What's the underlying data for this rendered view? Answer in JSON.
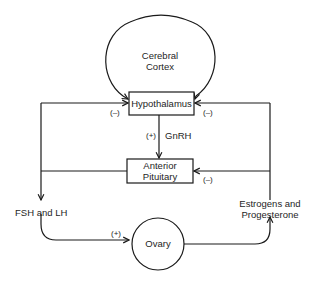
{
  "diagram": {
    "type": "flowchart",
    "title": "",
    "nodes": [
      {
        "id": "cortex",
        "label_lines": [
          "Cerebral",
          "Cortex"
        ],
        "shape": "ellipse"
      },
      {
        "id": "hypothalamus",
        "label": "Hypothalamus",
        "shape": "rectangle"
      },
      {
        "id": "pituitary",
        "label_lines": [
          "Anterior",
          "Pituitary"
        ],
        "shape": "rectangle"
      },
      {
        "id": "ovary",
        "label": "Ovary",
        "shape": "circle"
      }
    ],
    "edge_labels": {
      "gnrh": "GnRH",
      "gnrh_sign": "(+)",
      "fsh_lh": "FSH and LH",
      "ovary_sign": "(+)",
      "hormones_line1": "Estrogens and",
      "hormones_line2": "Progesterone",
      "neg_hypo_left": "(–)",
      "neg_hypo_right": "(–)",
      "neg_pituitary_right": "(–)"
    },
    "edges": [
      {
        "from": "hypothalamus",
        "to": "pituitary",
        "label": "GnRH",
        "sign": "+"
      },
      {
        "from": "pituitary",
        "to": "ovary",
        "label": "FSH and LH",
        "sign": "+"
      },
      {
        "from": "pituitary",
        "to": "hypothalamus",
        "sign": "-",
        "note": "short loop feedback via left line"
      },
      {
        "from": "ovary",
        "to": "pituitary",
        "label": "Estrogens and Progesterone",
        "sign": "-"
      },
      {
        "from": "ovary",
        "to": "hypothalamus",
        "label": "Estrogens and Progesterone",
        "sign": "-"
      },
      {
        "from": "cortex",
        "to": "hypothalamus"
      }
    ],
    "colors": {
      "stroke": "#1a1a1a",
      "background": "#ffffff"
    }
  },
  "labels": {
    "cortex_1": "Cerebral",
    "cortex_2": "Cortex",
    "hypothalamus": "Hypothalamus",
    "pituitary_1": "Anterior",
    "pituitary_2": "Pituitary",
    "ovary": "Ovary"
  }
}
